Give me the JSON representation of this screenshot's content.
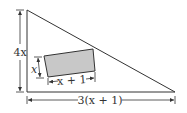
{
  "diagram": {
    "type": "geometry",
    "colors": {
      "stroke": "#333333",
      "rect_fill": "#c8c8c8",
      "background": "#ffffff"
    },
    "triangle": {
      "height_label": "4x",
      "base_label": "3(x + 1)"
    },
    "rectangle": {
      "width_label": "x + 1",
      "height_label": "x"
    }
  }
}
